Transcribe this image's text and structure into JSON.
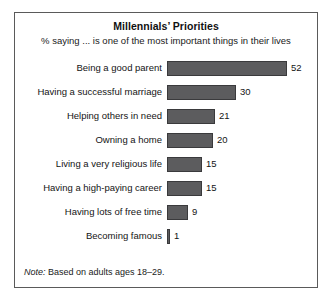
{
  "chart_data": {
    "type": "bar",
    "orientation": "horizontal",
    "title": "Millennials’ Priorities",
    "subtitle": "% saying ... is one of the most important things in their lives",
    "xlabel": "",
    "ylabel": "",
    "xlim": [
      0,
      52
    ],
    "grid": false,
    "legend": false,
    "note_lead": "Note:",
    "note_text": " Based on adults ages 18–29.",
    "bar_color": "#5c5c5e",
    "bar_border_color": "#3a3a3c",
    "categories": [
      "Being a good parent",
      "Having a successful marriage",
      "Helping others in need",
      "Owning a home",
      "Living a very religious life",
      "Having a high-paying career",
      "Having lots of free time",
      "Becoming famous"
    ],
    "values": [
      52,
      30,
      21,
      20,
      15,
      15,
      9,
      1
    ],
    "value_labels": [
      "52",
      "30",
      "21",
      "20",
      "15",
      "15",
      "9",
      "1"
    ]
  }
}
